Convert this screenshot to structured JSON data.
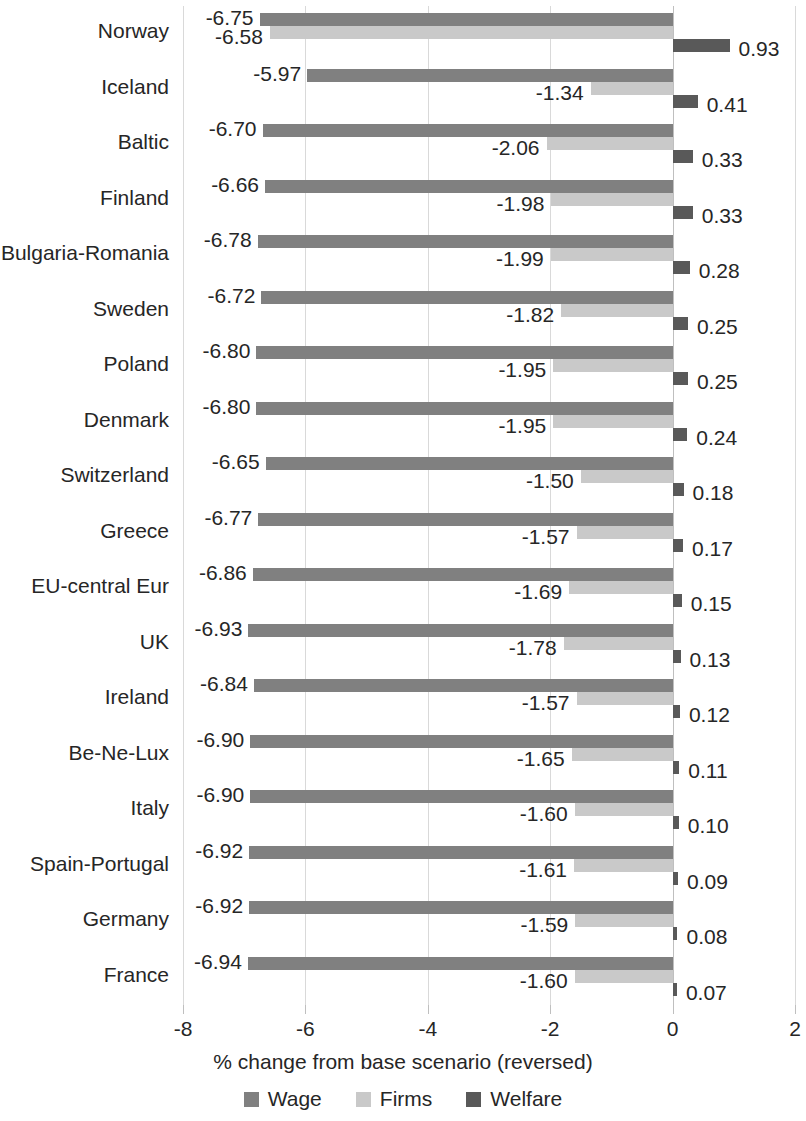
{
  "chart_data": {
    "type": "bar",
    "orientation": "horizontal",
    "title": "",
    "xlabel": "% change from base scenario (reversed)",
    "ylabel": "",
    "xlim": [
      -8,
      2
    ],
    "xticks": [
      "-8",
      "-6",
      "-4",
      "-2",
      "0",
      "2"
    ],
    "xtick_values": [
      -8,
      -6,
      -4,
      -2,
      0,
      2
    ],
    "grid": true,
    "legend_position": "bottom",
    "categories": [
      "Norway",
      "Iceland",
      "Baltic",
      "Finland",
      "Bulgaria-Romania",
      "Sweden",
      "Poland",
      "Denmark",
      "Switzerland",
      "Greece",
      "EU-central Eur",
      "UK",
      "Ireland",
      "Be-Ne-Lux",
      "Italy",
      "Spain-Portugal",
      "Germany",
      "France"
    ],
    "series": [
      {
        "name": "Wage",
        "color": "#808080",
        "values": [
          -6.75,
          -5.97,
          -6.7,
          -6.66,
          -6.78,
          -6.72,
          -6.8,
          -6.8,
          -6.65,
          -6.77,
          -6.86,
          -6.93,
          -6.84,
          -6.9,
          -6.9,
          -6.92,
          -6.92,
          -6.94
        ],
        "labels": [
          "-6.75",
          "-5.97",
          "-6.70",
          "-6.66",
          "-6.78",
          "-6.72",
          "-6.80",
          "-6.80",
          "-6.65",
          "-6.77",
          "-6.86",
          "-6.93",
          "-6.84",
          "-6.90",
          "-6.90",
          "-6.92",
          "-6.92",
          "-6.94"
        ]
      },
      {
        "name": "Firms",
        "color": "#c9c9c9",
        "values": [
          -6.58,
          -1.34,
          -2.06,
          -1.98,
          -1.99,
          -1.82,
          -1.95,
          -1.95,
          -1.5,
          -1.57,
          -1.69,
          -1.78,
          -1.57,
          -1.65,
          -1.6,
          -1.61,
          -1.59,
          -1.6
        ],
        "labels": [
          "-6.58",
          "-1.34",
          "-2.06",
          "-1.98",
          "-1.99",
          "-1.82",
          "-1.95",
          "-1.95",
          "-1.50",
          "-1.57",
          "-1.69",
          "-1.78",
          "-1.57",
          "-1.65",
          "-1.60",
          "-1.61",
          "-1.59",
          "-1.60"
        ]
      },
      {
        "name": "Welfare",
        "color": "#595959",
        "values": [
          0.93,
          0.41,
          0.33,
          0.33,
          0.28,
          0.25,
          0.25,
          0.24,
          0.18,
          0.17,
          0.15,
          0.13,
          0.12,
          0.11,
          0.1,
          0.09,
          0.08,
          0.07
        ],
        "labels": [
          "0.93",
          "0.41",
          "0.33",
          "0.33",
          "0.28",
          "0.25",
          "0.25",
          "0.24",
          "0.18",
          "0.17",
          "0.15",
          "0.13",
          "0.12",
          "0.11",
          "0.10",
          "0.09",
          "0.08",
          "0.07"
        ]
      }
    ]
  },
  "legend": {
    "items": [
      {
        "label": "Wage",
        "color": "#808080"
      },
      {
        "label": "Firms",
        "color": "#c9c9c9"
      },
      {
        "label": "Welfare",
        "color": "#595959"
      }
    ]
  },
  "axis": {
    "x_title": "% change from base scenario (reversed)"
  }
}
